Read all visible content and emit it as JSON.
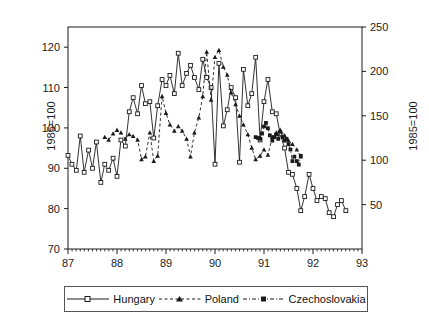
{
  "chart_data": {
    "type": "line",
    "title": "",
    "xlabel": "",
    "ylabel": "1985=100",
    "ylabel_right": "1985=100",
    "xlim": [
      87.0,
      93.0
    ],
    "ylim_left": [
      70,
      125
    ],
    "ylim_right": [
      0,
      250
    ],
    "grid": false,
    "legend_position": "bottom",
    "xticks": [
      "87",
      "88",
      "89",
      "90",
      "91",
      "92",
      "93"
    ],
    "xtick_values": [
      87,
      88,
      89,
      90,
      91,
      92,
      93
    ],
    "yticks_left": [
      "70",
      "80",
      "90",
      "100",
      "110",
      "120"
    ],
    "ytick_values_left": [
      70,
      80,
      90,
      100,
      110,
      120
    ],
    "yticks_right": [
      "50",
      "100",
      "150",
      "200",
      "250"
    ],
    "ytick_values_right": [
      50,
      100,
      150,
      200,
      250
    ],
    "minor_ticks_per_major_x": 12,
    "series": [
      {
        "name": "Hungary",
        "axis": "left",
        "line_style": "solid",
        "marker": "open-square",
        "color": "#1a1a1a",
        "x": [
          87.0,
          87.08,
          87.17,
          87.25,
          87.33,
          87.42,
          87.5,
          87.58,
          87.67,
          87.75,
          87.83,
          87.92,
          88.0,
          88.08,
          88.17,
          88.25,
          88.33,
          88.42,
          88.5,
          88.58,
          88.67,
          88.75,
          88.83,
          88.92,
          89.0,
          89.08,
          89.17,
          89.25,
          89.33,
          89.42,
          89.5,
          89.58,
          89.67,
          89.75,
          89.83,
          89.92,
          90.0,
          90.08,
          90.17,
          90.25,
          90.33,
          90.42,
          90.5,
          90.58,
          90.67,
          90.75,
          90.83,
          90.92,
          91.0,
          91.08,
          91.17,
          91.25,
          91.33,
          91.42,
          91.5,
          91.58,
          91.67,
          91.75,
          91.83,
          91.92,
          92.0,
          92.08,
          92.17,
          92.25,
          92.33,
          92.42,
          92.5,
          92.58,
          92.67
        ],
        "values": [
          93.2,
          91.0,
          89.5,
          98.0,
          89.0,
          94.5,
          90.0,
          96.5,
          86.5,
          91.0,
          89.5,
          92.5,
          88.0,
          97.0,
          95.5,
          104.0,
          107.5,
          103.5,
          110.5,
          106.0,
          106.5,
          97.5,
          105.5,
          112.0,
          110.5,
          113.0,
          108.5,
          118.5,
          110.5,
          113.5,
          115.5,
          112.5,
          109.5,
          117.0,
          112.5,
          110.0,
          91.0,
          116.0,
          100.5,
          104.5,
          110.0,
          107.5,
          91.5,
          114.5,
          105.5,
          108.5,
          117.5,
          97.0,
          106.5,
          112.0,
          104.0,
          103.5,
          98.5,
          95.0,
          89.0,
          88.5,
          85.0,
          79.5,
          83.0,
          88.5,
          85.0,
          82.0,
          83.0,
          82.5,
          79.0,
          78.0,
          81.0,
          82.0,
          79.5
        ]
      },
      {
        "name": "Poland",
        "axis": "right",
        "line_style": "dashed",
        "marker": "filled-triangle",
        "color": "#1a1a1a",
        "x": [
          87.75,
          87.83,
          87.92,
          88.0,
          88.08,
          88.17,
          88.25,
          88.33,
          88.42,
          88.5,
          88.58,
          88.67,
          88.75,
          88.83,
          88.92,
          89.0,
          89.08,
          89.17,
          89.25,
          89.33,
          89.42,
          89.5,
          89.58,
          89.67,
          89.75,
          89.83,
          89.92,
          90.0,
          90.08,
          90.17,
          90.25,
          90.33,
          90.42,
          90.5,
          90.58,
          90.67,
          90.75,
          90.83,
          90.92,
          91.0,
          91.08,
          91.17,
          91.25,
          91.33,
          91.42,
          91.5,
          91.58,
          91.67,
          91.75
        ],
        "values": [
          126,
          123,
          130,
          134,
          131,
          124,
          129,
          127,
          123,
          101,
          104,
          131,
          99,
          105,
          172,
          153,
          140,
          133,
          138,
          133,
          124,
          104,
          131,
          148,
          172,
          222,
          168,
          216,
          224,
          205,
          196,
          176,
          163,
          150,
          140,
          129,
          114,
          101,
          105,
          112,
          106,
          126,
          131,
          134,
          128,
          122,
          118,
          112,
          104
        ]
      },
      {
        "name": "Czechoslovakia",
        "axis": "right",
        "line_style": "dash-dot",
        "marker": "filled-square",
        "color": "#1a1a1a",
        "x": [
          90.83,
          90.92,
          91.0,
          91.08,
          91.17,
          91.25,
          91.33,
          91.42,
          91.5,
          91.58,
          91.67,
          91.75
        ],
        "values": [
          126,
          124,
          138,
          142,
          122,
          126,
          132,
          122,
          118,
          99,
          95,
          105
        ]
      }
    ],
    "czechoslovakia_detail": {
      "x": [
        90.83,
        90.88,
        90.92,
        90.96,
        91.0,
        91.04,
        91.08,
        91.12,
        91.17,
        91.21,
        91.25,
        91.29,
        91.33,
        91.38,
        91.42,
        91.46,
        91.5,
        91.54,
        91.58,
        91.62,
        91.67,
        91.71,
        91.75
      ],
      "values": [
        126,
        125,
        124,
        130,
        138,
        142,
        136,
        128,
        122,
        126,
        129,
        124,
        132,
        126,
        122,
        124,
        118,
        112,
        99,
        104,
        99,
        95,
        105
      ]
    },
    "annotations": []
  },
  "legend": {
    "items": [
      {
        "label": "Hungary",
        "style": "solid-open-square"
      },
      {
        "label": "Poland",
        "style": "dashed-triangle"
      },
      {
        "label": "Czechoslovakia",
        "style": "dashdot-filled-square"
      }
    ]
  },
  "colors": {
    "axis": "#1a1a1a",
    "series": "#1a1a1a",
    "background": "#ffffff",
    "legend_border": "#555555"
  }
}
